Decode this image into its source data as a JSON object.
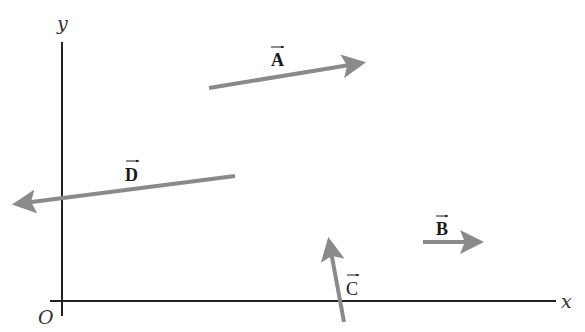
{
  "figure": {
    "axes": {
      "x_label": "x",
      "y_label": "y",
      "origin_label": "O",
      "color": "#222222"
    },
    "vector_color": "#8a8a8a",
    "vectors": [
      {
        "name": "A",
        "label": "A",
        "x1": 209,
        "y1": 88,
        "x2": 362,
        "y2": 63,
        "lx": 277,
        "ly": 66
      },
      {
        "name": "B",
        "label": "B",
        "x1": 423,
        "y1": 242,
        "x2": 480,
        "y2": 242,
        "lx": 441,
        "ly": 234
      },
      {
        "name": "C",
        "label": "C",
        "x1": 344,
        "y1": 322,
        "x2": 329,
        "y2": 241,
        "lx": 352,
        "ly": 294
      },
      {
        "name": "D",
        "label": "D",
        "x1": 235,
        "y1": 176,
        "x2": 16,
        "y2": 204,
        "lx": 133,
        "ly": 180
      }
    ]
  }
}
